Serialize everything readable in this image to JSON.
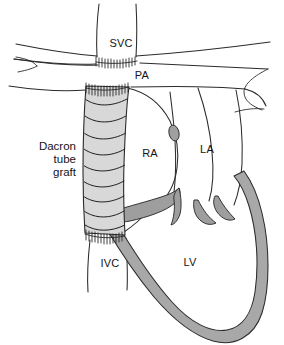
{
  "figure": {
    "background_color": "#ffffff",
    "width": 284,
    "height": 345
  },
  "colors": {
    "outline": "#2b2b2b",
    "graft_fill": "#d8d8d8",
    "myocardium_fill": "#a8a8a8",
    "valve_fill": "#9e9e9e",
    "fossa_ovalis_fill": "#a0a0a0",
    "background": "#ffffff",
    "label_text": "#141414"
  },
  "labels": {
    "svc": {
      "text": "SVC",
      "x": 121,
      "y": 47
    },
    "pa": {
      "text": "PA",
      "x": 140,
      "y": 78
    },
    "ra": {
      "text": "RA",
      "x": 150,
      "y": 156
    },
    "la": {
      "text": "LA",
      "x": 207,
      "y": 153
    },
    "lv": {
      "text": "LV",
      "x": 190,
      "y": 265
    },
    "ivc": {
      "text": "IVC",
      "x": 110,
      "y": 266
    },
    "graft": {
      "lines": [
        "Dacron",
        "tube",
        "graft"
      ],
      "x": 76,
      "y_start": 150,
      "line_height": 13,
      "align": "end"
    }
  },
  "structures": [
    {
      "name": "superior-vena-cava",
      "label": "SVC",
      "type": "vessel"
    },
    {
      "name": "pulmonary-artery",
      "label": "PA",
      "type": "vessel"
    },
    {
      "name": "inferior-vena-cava",
      "label": "IVC",
      "type": "vessel"
    },
    {
      "name": "right-atrium",
      "label": "RA",
      "type": "chamber"
    },
    {
      "name": "left-atrium",
      "label": "LA",
      "type": "chamber"
    },
    {
      "name": "left-ventricle",
      "label": "LV",
      "type": "chamber"
    },
    {
      "name": "dacron-tube-graft",
      "label": "Dacron tube graft",
      "type": "prosthesis"
    },
    {
      "name": "atrial-septum",
      "label": "",
      "type": "septum"
    },
    {
      "name": "fossa-ovalis",
      "label": "",
      "type": "landmark"
    },
    {
      "name": "tricuspid-valve",
      "label": "",
      "type": "valve"
    },
    {
      "name": "mitral-valve",
      "label": "",
      "type": "valve"
    }
  ],
  "suture_lines": [
    {
      "name": "svc-graft-anastomosis",
      "segments": 13
    },
    {
      "name": "graft-upper-anastomosis",
      "segments": 14
    },
    {
      "name": "graft-ivc-anastomosis",
      "segments": 13
    }
  ],
  "graft_corrugations": 9
}
